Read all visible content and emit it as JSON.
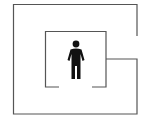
{
  "diagram": {
    "type": "maze-with-person",
    "wall_color": "#555555",
    "person_color": "#111111",
    "background": "#ffffff",
    "icon": "person-icon"
  }
}
